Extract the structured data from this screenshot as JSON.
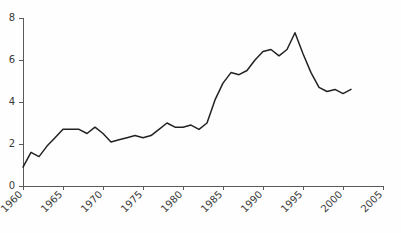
{
  "chart_data": {
    "type": "line",
    "title": "",
    "subtitle": "",
    "xlabel": "",
    "ylabel": "",
    "xlim": [
      1960,
      2005
    ],
    "ylim": [
      0,
      8
    ],
    "grid": false,
    "legend": false,
    "legend_position": "none",
    "line_color": "#222222",
    "axis_color": "#5a5a5a",
    "background_color": "#fefefe",
    "x_tick_labels": [
      "1960",
      "1965",
      "1970",
      "1975",
      "1980",
      "1985",
      "1990",
      "1995",
      "2000",
      "2005"
    ],
    "x_tick_values": [
      1960,
      1965,
      1970,
      1975,
      1980,
      1985,
      1990,
      1995,
      2000,
      2005
    ],
    "x_tick_label_rotation": -45,
    "y_tick_labels": [
      "0",
      "2",
      "4",
      "6",
      "8"
    ],
    "y_tick_values": [
      0,
      2,
      4,
      6,
      8
    ],
    "series": [
      {
        "name": "series-1",
        "x": [
          1960,
          1961,
          1962,
          1963,
          1964,
          1965,
          1966,
          1967,
          1968,
          1969,
          1970,
          1971,
          1972,
          1973,
          1974,
          1975,
          1976,
          1977,
          1978,
          1979,
          1980,
          1981,
          1982,
          1983,
          1984,
          1985,
          1986,
          1987,
          1988,
          1989,
          1990,
          1991,
          1992,
          1993,
          1994,
          1995,
          1996,
          1997,
          1998,
          1999,
          2000,
          2001
        ],
        "values": [
          0.9,
          1.6,
          1.4,
          1.9,
          2.3,
          2.7,
          2.7,
          2.7,
          2.5,
          2.8,
          2.5,
          2.1,
          2.2,
          2.3,
          2.4,
          2.3,
          2.4,
          2.7,
          3.0,
          2.8,
          2.8,
          2.9,
          2.7,
          3.0,
          4.1,
          4.9,
          5.4,
          5.3,
          5.5,
          6.0,
          6.4,
          6.5,
          6.2,
          6.5,
          7.3,
          6.3,
          5.4,
          4.7,
          4.5,
          4.6,
          4.4,
          4.6
        ]
      }
    ]
  },
  "plot_geometry": {
    "left": 23,
    "right": 383,
    "top": 18,
    "bottom": 186
  }
}
